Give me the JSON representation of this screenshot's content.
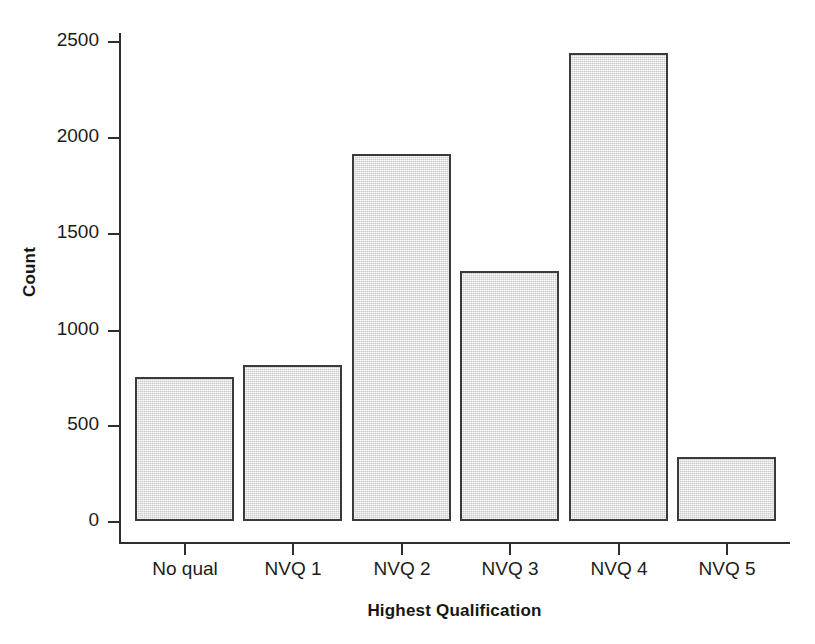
{
  "chart_data": {
    "type": "bar",
    "title": "",
    "xlabel": "Highest Qualification",
    "ylabel": "Count",
    "categories": [
      "No qual",
      "NVQ 1",
      "NVQ 2",
      "NVQ 3",
      "NVQ 4",
      "NVQ 5"
    ],
    "values": [
      750,
      815,
      1910,
      1300,
      2440,
      335
    ],
    "ylim": [
      0,
      2600
    ],
    "yticks": [
      0,
      500,
      1000,
      1500,
      2000,
      2500
    ],
    "ytick_labels": [
      "0",
      "500",
      "1000",
      "1500",
      "2000",
      "2500"
    ],
    "grid": false,
    "legend": "none",
    "bar_fill_color": "#dadada",
    "bar_border_color": "#3a3a3a",
    "axis_color": "#2e2e2e",
    "background_color": "#ffffff"
  }
}
